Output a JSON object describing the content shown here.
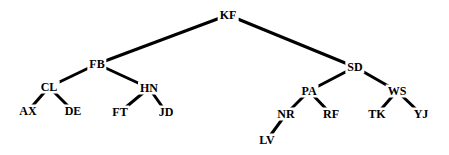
{
  "diagram": {
    "type": "binary-tree",
    "background": "#ffffff",
    "edge_color": "#000000",
    "nodes": [
      {
        "id": "KF",
        "label": "KF",
        "x": 228,
        "y": 15
      },
      {
        "id": "FB",
        "label": "FB",
        "x": 97,
        "y": 64
      },
      {
        "id": "SD",
        "label": "SD",
        "x": 355,
        "y": 67
      },
      {
        "id": "CL",
        "label": "CL",
        "x": 49,
        "y": 87
      },
      {
        "id": "HN",
        "label": "HN",
        "x": 149,
        "y": 88
      },
      {
        "id": "AX",
        "label": "AX",
        "x": 28,
        "y": 111
      },
      {
        "id": "DE",
        "label": "DE",
        "x": 73,
        "y": 111
      },
      {
        "id": "FT",
        "label": "FT",
        "x": 120,
        "y": 112
      },
      {
        "id": "JD",
        "label": "JD",
        "x": 166,
        "y": 112
      },
      {
        "id": "PA",
        "label": "PA",
        "x": 309,
        "y": 91
      },
      {
        "id": "WS",
        "label": "WS",
        "x": 397,
        "y": 91
      },
      {
        "id": "NR",
        "label": "NR",
        "x": 286,
        "y": 114
      },
      {
        "id": "RF",
        "label": "RF",
        "x": 331,
        "y": 114
      },
      {
        "id": "TK",
        "label": "TK",
        "x": 377,
        "y": 114
      },
      {
        "id": "YJ",
        "label": "YJ",
        "x": 421,
        "y": 114
      },
      {
        "id": "LV",
        "label": "LV",
        "x": 267,
        "y": 140
      }
    ],
    "edges": [
      [
        "KF",
        "FB"
      ],
      [
        "KF",
        "SD"
      ],
      [
        "FB",
        "CL"
      ],
      [
        "FB",
        "HN"
      ],
      [
        "CL",
        "AX"
      ],
      [
        "CL",
        "DE"
      ],
      [
        "HN",
        "FT"
      ],
      [
        "HN",
        "JD"
      ],
      [
        "SD",
        "PA"
      ],
      [
        "SD",
        "WS"
      ],
      [
        "PA",
        "NR"
      ],
      [
        "PA",
        "RF"
      ],
      [
        "NR",
        "LV"
      ],
      [
        "WS",
        "TK"
      ],
      [
        "WS",
        "YJ"
      ]
    ]
  },
  "labels": {
    "KF": "KF",
    "FB": "FB",
    "SD": "SD",
    "CL": "CL",
    "HN": "HN",
    "AX": "AX",
    "DE": "DE",
    "FT": "FT",
    "JD": "JD",
    "PA": "PA",
    "WS": "WS",
    "NR": "NR",
    "RF": "RF",
    "TK": "TK",
    "YJ": "YJ",
    "LV": "LV"
  }
}
